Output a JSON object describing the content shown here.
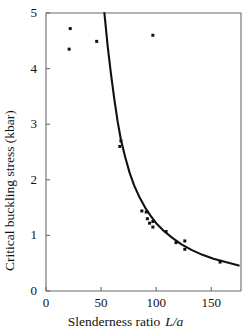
{
  "chart_data": {
    "type": "scatter",
    "title": "",
    "xlabel": "Slenderness ratio L/a",
    "xlabel_text": "Slenderness ratio",
    "xlabel_symbol": "L/a",
    "ylabel": "Critical buckling stress (kbar)",
    "xlim": [
      0,
      177
    ],
    "ylim": [
      0,
      5
    ],
    "xticks": [
      0,
      50,
      100,
      150
    ],
    "yticks": [
      0,
      1,
      2,
      3,
      4,
      5
    ],
    "xtick_labels": [
      "0",
      "50",
      "100",
      "150"
    ],
    "ytick_labels": [
      "0",
      "1",
      "2",
      "3",
      "4",
      "5"
    ],
    "grid": false,
    "legend": false,
    "marker": "square-dot",
    "marker_color": "#111111",
    "curve_color": "#111111",
    "axis_color": "#555555",
    "background": "#ffffff",
    "series": [
      {
        "name": "Measured buckling stress",
        "type": "scatter",
        "points": [
          {
            "x": 22,
            "y": 4.72
          },
          {
            "x": 21,
            "y": 4.35
          },
          {
            "x": 46,
            "y": 4.49
          },
          {
            "x": 97,
            "y": 4.6
          },
          {
            "x": 68,
            "y": 2.7
          },
          {
            "x": 67,
            "y": 2.6
          },
          {
            "x": 87,
            "y": 1.44
          },
          {
            "x": 91,
            "y": 1.42
          },
          {
            "x": 92,
            "y": 1.3
          },
          {
            "x": 94,
            "y": 1.22
          },
          {
            "x": 97,
            "y": 1.25
          },
          {
            "x": 97,
            "y": 1.15
          },
          {
            "x": 109,
            "y": 1.07
          },
          {
            "x": 118,
            "y": 0.87
          },
          {
            "x": 126,
            "y": 0.9
          },
          {
            "x": 126,
            "y": 0.75
          },
          {
            "x": 158,
            "y": 0.52
          }
        ]
      },
      {
        "name": "Euler buckling theory",
        "type": "line",
        "equation_note": "inverse-square fit",
        "points": [
          {
            "x": 53,
            "y": 5.0
          },
          {
            "x": 56,
            "y": 4.4
          },
          {
            "x": 59,
            "y": 3.9
          },
          {
            "x": 62,
            "y": 3.45
          },
          {
            "x": 65,
            "y": 3.05
          },
          {
            "x": 68,
            "y": 2.72
          },
          {
            "x": 72,
            "y": 2.4
          },
          {
            "x": 76,
            "y": 2.12
          },
          {
            "x": 80,
            "y": 1.9
          },
          {
            "x": 85,
            "y": 1.68
          },
          {
            "x": 90,
            "y": 1.5
          },
          {
            "x": 95,
            "y": 1.35
          },
          {
            "x": 100,
            "y": 1.22
          },
          {
            "x": 107,
            "y": 1.08
          },
          {
            "x": 115,
            "y": 0.95
          },
          {
            "x": 123,
            "y": 0.84
          },
          {
            "x": 132,
            "y": 0.74
          },
          {
            "x": 142,
            "y": 0.65
          },
          {
            "x": 152,
            "y": 0.58
          },
          {
            "x": 163,
            "y": 0.52
          },
          {
            "x": 175,
            "y": 0.46
          }
        ]
      }
    ]
  },
  "axis": {
    "y_title": "Critical buckling stress (kbar)",
    "x_title": "Slenderness ratio",
    "x_symbol": "L/a"
  }
}
